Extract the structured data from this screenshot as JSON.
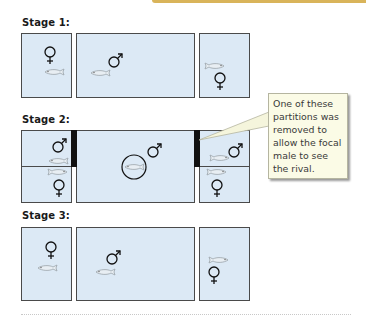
{
  "colors": {
    "tank_fill": "#dce9f5",
    "tank_border": "#4a4a4a",
    "partition": "#111111",
    "callout_fill": "#fbfbe6",
    "accent_bar": "#d9b45a"
  },
  "stages": [
    {
      "label": "Stage 1:",
      "tanks": [
        {
          "position": "left",
          "symbols": [
            "female"
          ],
          "fish": 1
        },
        {
          "position": "center",
          "symbols": [
            "male"
          ],
          "fish": 1
        },
        {
          "position": "right",
          "symbols": [
            "female"
          ],
          "fish": 1
        }
      ]
    },
    {
      "label": "Stage 2:",
      "tanks": [
        {
          "position": "left-top",
          "symbols": [
            "male"
          ],
          "fish": 1
        },
        {
          "position": "left-bottom",
          "symbols": [
            "female"
          ],
          "fish": 1
        },
        {
          "position": "center",
          "symbols": [
            "male"
          ],
          "fish": 1,
          "note": "focal male circled"
        },
        {
          "position": "right-top",
          "symbols": [
            "male"
          ],
          "fish": 1
        },
        {
          "position": "right-bottom",
          "symbols": [
            "female"
          ],
          "fish": 1
        }
      ],
      "partitions": [
        "left opaque partition",
        "right opaque partition"
      ]
    },
    {
      "label": "Stage 3:",
      "tanks": [
        {
          "position": "left",
          "symbols": [
            "female"
          ],
          "fish": 1
        },
        {
          "position": "center",
          "symbols": [
            "male"
          ],
          "fish": 1
        },
        {
          "position": "right",
          "symbols": [
            "female"
          ],
          "fish": 1
        }
      ]
    }
  ],
  "callout": {
    "text": "One of these partitions was removed to allow the focal male to see the rival."
  },
  "symbols": {
    "male": "♂",
    "female": "♀"
  }
}
